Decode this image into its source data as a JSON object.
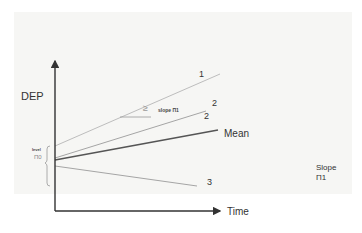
{
  "diagram": {
    "y_axis_label": "DEP",
    "x_axis_label": "Time",
    "lines": [
      {
        "id": "1",
        "label": "1",
        "color": "#b8b8b8",
        "x1": 55,
        "y1": 146,
        "x2": 220,
        "y2": 74
      },
      {
        "id": "2",
        "label": "2",
        "second_label": "2",
        "color": "#a8a8a8",
        "x1": 55,
        "y1": 158,
        "x2": 206,
        "y2": 111
      },
      {
        "id": "mean",
        "label": "Mean",
        "color": "#555555",
        "x1": 55,
        "y1": 160,
        "x2": 218,
        "y2": 130
      },
      {
        "id": "3",
        "label": "3",
        "color": "#a8a8a8",
        "x1": 55,
        "y1": 166,
        "x2": 197,
        "y2": 186
      }
    ],
    "level_annotation": {
      "word": "level",
      "symbol": "Π0"
    },
    "slope_annotation": {
      "symbol_glyph": "≥",
      "text": "slope Π1"
    },
    "slope_legend": {
      "line1": "Slope",
      "line2": "Π1"
    },
    "colors": {
      "axis": "#333333",
      "background_panel": "#f6f6f4",
      "bracket": "#999999"
    }
  }
}
